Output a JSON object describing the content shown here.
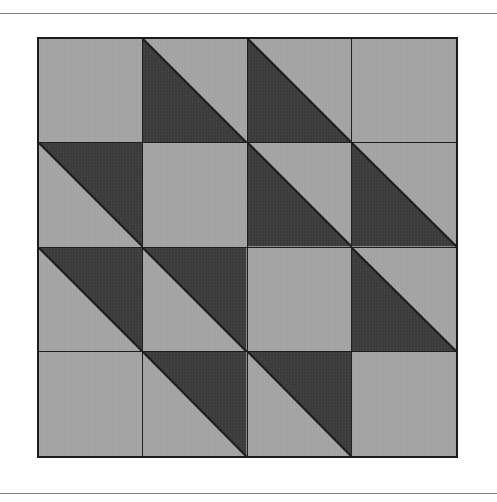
{
  "page": {
    "width": 497,
    "height": 502,
    "background_color": "#ffffff",
    "rule_color": "#7d7d7d",
    "top_rule_y": 13,
    "bottom_rule_y": 493
  },
  "figure": {
    "name": "quilt-block-diagram",
    "grid_rows": 4,
    "grid_cols": 4,
    "frame_color": "#1c1c1c",
    "light_color": "#a2a2a2",
    "dark_color": "#3b3b3b",
    "bounds": {
      "left": 37,
      "top": 37,
      "width": 421,
      "height": 421
    }
  },
  "chart_data": {
    "type": "heatmap",
    "title": "",
    "xlabel": "",
    "ylabel": "",
    "grid": true,
    "legend_position": "none",
    "rows": 4,
    "cols": 4,
    "value_legend": {
      "light": "plain light patch (no triangle)",
      "upper-right": "dark half-square triangle occupying the upper-right half (diagonal runs top-left to bottom-right)",
      "lower-left": "dark half-square triangle occupying the lower-left half (diagonal runs top-left to bottom-right)"
    },
    "colors": {
      "light": "#a2a2a2",
      "dark": "#3b3b3b",
      "line": "#1c1c1c"
    },
    "cells": [
      [
        "light",
        "lower-left",
        "lower-left",
        "light"
      ],
      [
        "upper-right",
        "light",
        "lower-left",
        "lower-left"
      ],
      [
        "upper-right",
        "upper-right",
        "light",
        "lower-left"
      ],
      [
        "light",
        "upper-right",
        "upper-right",
        "light"
      ]
    ]
  }
}
